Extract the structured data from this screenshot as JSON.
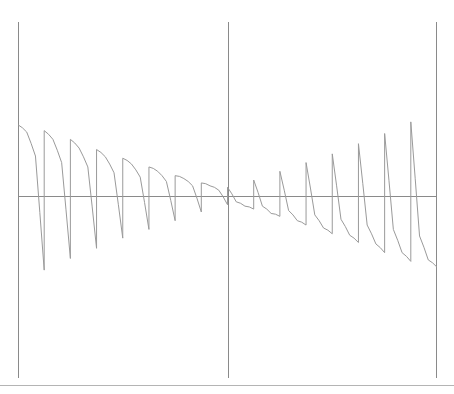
{
  "chart_data": {
    "type": "line",
    "title": "",
    "subtitle": "",
    "xlabel": "",
    "ylabel": "",
    "grid": false,
    "legend": null,
    "legend_position": "none",
    "annotations": [],
    "axis_ranges": {
      "x_pixels": [
        18,
        437
      ],
      "y_pixels": [
        22,
        378
      ],
      "x_axis_pixel_y": 196,
      "y_axis_pixel_x": 228
    },
    "xlim": [
      -6.2832,
      6.2832
    ],
    "ylim": [
      -2.45,
      2.45
    ],
    "x_tick_labels": [],
    "y_tick_labels": [],
    "vertical_rules_x": [
      -6.2832,
      0,
      6.2832
    ],
    "horizontal_rule_y": 0,
    "period": 1.5708,
    "series": [
      {
        "name": "sawtooth",
        "x": [
          -6.2832,
          -6.0214,
          -5.7596,
          -5.4978,
          -5.4978,
          -5.236,
          -4.9742,
          -4.7124,
          -4.7124,
          -4.4506,
          -4.1888,
          -3.927,
          -3.927,
          -3.6652,
          -3.4034,
          -3.1416,
          -3.1416,
          -2.8798,
          -2.618,
          -2.3562,
          -2.3562,
          -2.0944,
          -1.8326,
          -1.5708,
          -1.5708,
          -1.309,
          -1.0472,
          -0.7854,
          -0.7854,
          -0.5236,
          -0.2618,
          0.0,
          0.0,
          0.2618,
          0.5236,
          0.7854,
          0.7854,
          1.0472,
          1.309,
          1.5708,
          1.5708,
          1.8326,
          2.0944,
          2.3562,
          2.3562,
          2.618,
          2.8798,
          3.1416,
          3.1416,
          3.4034,
          3.6652,
          3.927,
          3.927,
          4.1888,
          4.4506,
          4.7124,
          4.7124,
          4.9742,
          5.236,
          5.4978,
          5.4978,
          5.7596,
          6.0214,
          6.2832
        ],
        "y": [
          0.98,
          0.88,
          0.55,
          -1.02,
          0.9,
          0.78,
          0.46,
          -0.86,
          0.78,
          0.66,
          0.4,
          -0.72,
          0.64,
          0.54,
          0.32,
          -0.58,
          0.52,
          0.44,
          0.26,
          -0.46,
          0.4,
          0.34,
          0.2,
          -0.34,
          0.28,
          0.24,
          0.14,
          -0.22,
          0.18,
          0.14,
          0.08,
          -0.12,
          0.12,
          -0.08,
          -0.14,
          -0.18,
          0.22,
          -0.14,
          -0.24,
          -0.28,
          0.34,
          -0.2,
          -0.34,
          -0.4,
          0.46,
          -0.26,
          -0.44,
          -0.52,
          0.58,
          -0.32,
          -0.54,
          -0.64,
          0.72,
          -0.4,
          -0.66,
          -0.78,
          0.86,
          -0.46,
          -0.78,
          -0.9,
          1.02,
          -0.55,
          -0.88,
          -0.98
        ]
      }
    ],
    "amplitude_by_tooth_pixels": [
      {
        "tooth": 1,
        "peak_y_px": 160,
        "trough_y_px": 232
      },
      {
        "tooth": 2,
        "peak_y_px": 164,
        "trough_y_px": 228
      },
      {
        "tooth": 3,
        "peak_y_px": 168,
        "trough_y_px": 224
      },
      {
        "tooth": 4,
        "peak_y_px": 173,
        "trough_y_px": 219
      },
      {
        "tooth": 5,
        "peak_y_px": 179,
        "trough_y_px": 213
      },
      {
        "tooth": 6,
        "peak_y_px": 185,
        "trough_y_px": 207
      },
      {
        "tooth": 7,
        "peak_y_px": 190,
        "trough_y_px": 202
      },
      {
        "tooth": 8,
        "peak_y_px": 194,
        "trough_y_px": 198
      }
    ]
  },
  "figure": {
    "background_color": "#ffffff",
    "curve_color": "#9a9a9a",
    "axis_color": "#8a8a8a",
    "rule_color": "#b4b4b4",
    "width_px": 454,
    "height_px": 394
  }
}
